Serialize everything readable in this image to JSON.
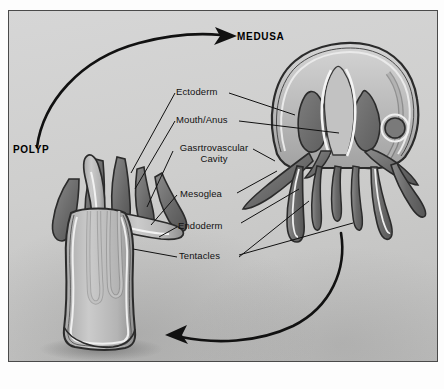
{
  "figure": {
    "type": "cnidarian-body-plan-life-cycle",
    "background_color": "#cfcfcf",
    "frame_border_color": "#4a4a4a",
    "ink_color": "#111111"
  },
  "headings": [
    {
      "id": "polyp",
      "text": "POLYP",
      "x": 12,
      "y": 143
    },
    {
      "id": "medusa",
      "text": "MEDUSA",
      "x": 236,
      "y": 30
    }
  ],
  "labels": [
    {
      "id": "ectoderm",
      "text": "Ectoderm",
      "x": 175,
      "y": 85,
      "width": 52
    },
    {
      "id": "mouth-anus",
      "text": "Mouth/Anus",
      "x": 175,
      "y": 113,
      "width": 62
    },
    {
      "id": "gastrovascular",
      "text": "Gasrtrovascular",
      "x": 171,
      "y": 141,
      "width": 80
    },
    {
      "id": "gastrovascular-2",
      "text": "Cavity",
      "x": 171,
      "y": 152,
      "width": 80
    },
    {
      "id": "mesoglea",
      "text": "Mesoglea",
      "x": 179,
      "y": 186,
      "width": 52
    },
    {
      "id": "endoderm",
      "text": "Endoderm",
      "x": 177,
      "y": 216,
      "width": 56
    },
    {
      "id": "tentacles",
      "text": "Tentacles",
      "x": 178,
      "y": 248,
      "width": 54
    }
  ],
  "arrows": [
    {
      "id": "polyp-to-medusa",
      "from": "POLYP",
      "to": "MEDUSA",
      "direction": "clockwise-top"
    },
    {
      "id": "medusa-to-polyp",
      "from": "MEDUSA",
      "to": "POLYP",
      "direction": "counter-clockwise-bottom"
    }
  ],
  "colors": {
    "tissue_dark": "#6f6f6f",
    "tissue_mid": "#9a9a9a",
    "tissue_light": "#c8c8c8",
    "canal_white": "#f2f2f2",
    "outline": "#2b2b2b"
  }
}
